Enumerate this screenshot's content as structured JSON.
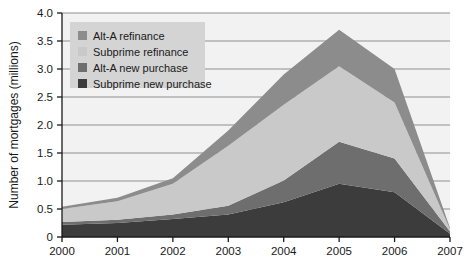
{
  "chart_data": {
    "type": "area",
    "title": "",
    "subtitle": "",
    "xlabel": "",
    "ylabel": "Number of mortgages (millions)",
    "categories": [
      "2000",
      "2001",
      "2002",
      "2003",
      "2004",
      "2005",
      "2006",
      "2007"
    ],
    "x": [
      2000,
      2001,
      2002,
      2003,
      2004,
      2005,
      2006,
      2007
    ],
    "xlim": [
      2000,
      2007
    ],
    "ylim": [
      0,
      4.0
    ],
    "ytick_labels": [
      "0",
      "0.5",
      "1.0",
      "1.5",
      "2.0",
      "2.5",
      "3.0",
      "3.5",
      "4.0"
    ],
    "ytick_values": [
      0,
      0.5,
      1.0,
      1.5,
      2.0,
      2.5,
      3.0,
      3.5,
      4.0
    ],
    "grid": true,
    "grid_axis": "y",
    "stacked": true,
    "stack_order_bottom_to_top": [
      "Subprime new purchase",
      "Alt-A new purchase",
      "Subprime refinance",
      "Alt-A refinance"
    ],
    "legend_position": "top-left",
    "series": [
      {
        "name": "Alt-A refinance",
        "color": "#8c8c8c",
        "values": [
          0.04,
          0.06,
          0.1,
          0.27,
          0.54,
          0.65,
          0.6,
          0.02
        ]
      },
      {
        "name": "Subprime refinance",
        "color": "#c9c9c9",
        "values": [
          0.23,
          0.33,
          0.55,
          1.07,
          1.35,
          1.35,
          1.0,
          0.04
        ]
      },
      {
        "name": "Alt-A new purchase",
        "color": "#6e6e6e",
        "values": [
          0.05,
          0.06,
          0.08,
          0.16,
          0.39,
          0.75,
          0.6,
          0.04
        ]
      },
      {
        "name": "Subprime new purchase",
        "color": "#3c3c3c",
        "values": [
          0.22,
          0.25,
          0.32,
          0.4,
          0.62,
          0.95,
          0.8,
          0.06
        ]
      }
    ],
    "cumulative_totals": [
      0.54,
      0.7,
      1.05,
      1.9,
      2.9,
      3.7,
      3.0,
      0.16
    ]
  },
  "legend": {
    "items": [
      {
        "label": "Alt-A refinance",
        "color": "#8c8c8c"
      },
      {
        "label": "Subprime refinance",
        "color": "#c9c9c9"
      },
      {
        "label": "Alt-A new purchase",
        "color": "#6e6e6e"
      },
      {
        "label": "Subprime new purchase",
        "color": "#3c3c3c"
      }
    ],
    "background": "#d4d4d4"
  },
  "style": {
    "plot_background": "#f2f2f2",
    "axis_color": "#1a1a1a",
    "grid_color": "#8f8f8f"
  }
}
